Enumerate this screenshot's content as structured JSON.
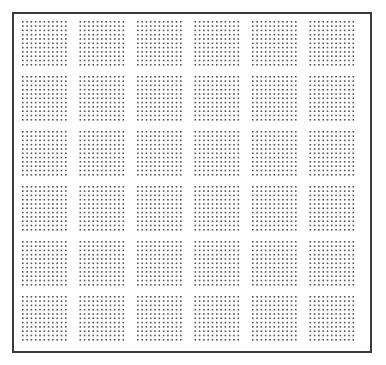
{
  "pattern": {
    "name": "dot-grid",
    "block_rows": 6,
    "block_cols": 6,
    "dots_per_block_row": 11,
    "dots_per_block_col": 11,
    "dot_color": "#555555",
    "border_color": "#3a3a3a",
    "background_color": "#ffffff"
  }
}
